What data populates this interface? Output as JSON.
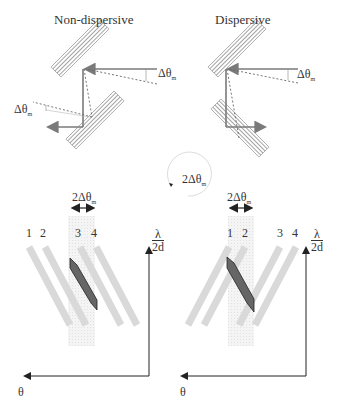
{
  "panels": {
    "left": {
      "title": "Non-dispersive",
      "delta_upper": "Δθ",
      "delta_upper_sub": "m",
      "delta_lower": "Δθ",
      "delta_lower_sub": "m",
      "width_label": "2Δθ",
      "width_label_sub": "m",
      "stripe_numbers": [
        "1",
        "2",
        "3",
        "4"
      ],
      "axis_y_num": "λ",
      "axis_y_den": "2d",
      "axis_x": "θ"
    },
    "right": {
      "title": "Dispersive",
      "delta_upper": "Δθ",
      "delta_upper_sub": "m",
      "width_label": "2Δθ",
      "width_label_sub": "m",
      "stripe_numbers": [
        "1",
        "2",
        "3",
        "4"
      ],
      "axis_y_num": "λ",
      "axis_y_den": "2d",
      "axis_x": "θ"
    },
    "rotation": {
      "label": "2Δθ",
      "label_sub": "m"
    }
  },
  "colors": {
    "crystal_hatch": "#8a8a8a",
    "beam": "#7a7a7a",
    "stripe": "#d9d9d9",
    "window": "#eeeeee",
    "parallelogram": "#666666",
    "axis": "#222222"
  }
}
